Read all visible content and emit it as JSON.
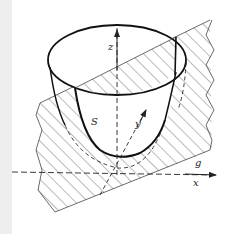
{
  "figure": {
    "labels": {
      "z": "z",
      "y": "y",
      "x": "x",
      "S": "S",
      "g": "g"
    },
    "colors": {
      "line": "#222222",
      "hatch": "#555555",
      "strip": "#eeeeee"
    }
  }
}
